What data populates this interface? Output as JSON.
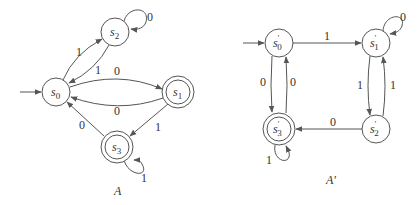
{
  "diagrams": [
    {
      "caption": "A",
      "states": [
        {
          "id": "s0",
          "base": "s",
          "sub": "0",
          "prime": "",
          "accepting": false,
          "start": true
        },
        {
          "id": "s1",
          "base": "s",
          "sub": "1",
          "prime": "",
          "accepting": true,
          "start": false
        },
        {
          "id": "s2",
          "base": "s",
          "sub": "2",
          "prime": "",
          "accepting": false,
          "start": false
        },
        {
          "id": "s3",
          "base": "s",
          "sub": "3",
          "prime": "",
          "accepting": true,
          "start": false
        }
      ],
      "transitions": [
        {
          "from": "s0",
          "to": "s2",
          "label": "1"
        },
        {
          "from": "s2",
          "to": "s0",
          "label": "1"
        },
        {
          "from": "s2",
          "to": "s2",
          "label": "0"
        },
        {
          "from": "s0",
          "to": "s1",
          "label": "0"
        },
        {
          "from": "s1",
          "to": "s0",
          "label": "0"
        },
        {
          "from": "s1",
          "to": "s3",
          "label": "1"
        },
        {
          "from": "s3",
          "to": "s0",
          "label": "0"
        },
        {
          "from": "s3",
          "to": "s3",
          "label": "1"
        }
      ]
    },
    {
      "caption": "A'",
      "states": [
        {
          "id": "s0'",
          "base": "s",
          "sub": "0",
          "prime": "'",
          "accepting": false,
          "start": true
        },
        {
          "id": "s1'",
          "base": "s",
          "sub": "1",
          "prime": "'",
          "accepting": false,
          "start": false
        },
        {
          "id": "s2'",
          "base": "s",
          "sub": "2",
          "prime": "'",
          "accepting": false,
          "start": false
        },
        {
          "id": "s3'",
          "base": "s",
          "sub": "3",
          "prime": "'",
          "accepting": true,
          "start": false
        }
      ],
      "transitions": [
        {
          "from": "s0'",
          "to": "s1'",
          "label": "1"
        },
        {
          "from": "s1'",
          "to": "s1'",
          "label": "0"
        },
        {
          "from": "s1'",
          "to": "s2'",
          "label": "1"
        },
        {
          "from": "s2'",
          "to": "s1'",
          "label": "1"
        },
        {
          "from": "s2'",
          "to": "s3'",
          "label": "0"
        },
        {
          "from": "s0'",
          "to": "s3'",
          "label": "0"
        },
        {
          "from": "s3'",
          "to": "s0'",
          "label": "0"
        },
        {
          "from": "s3'",
          "to": "s3'",
          "label": "1"
        }
      ]
    }
  ]
}
